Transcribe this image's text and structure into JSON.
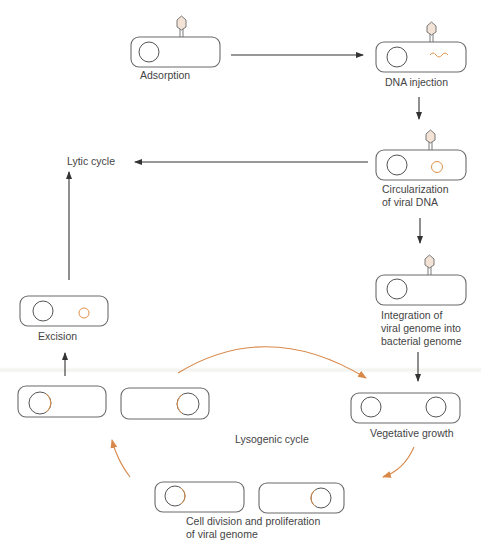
{
  "colors": {
    "cell_outline": "#6b6b6b",
    "bacterial_chromosome": "#555555",
    "viral_dna": "#e0924a",
    "lysogenic_arrows": "#d8894a",
    "main_arrows": "#333333"
  },
  "stages": [
    {
      "id": "adsorption",
      "label": "Adsorption"
    },
    {
      "id": "dna-injection",
      "label": "DNA injection"
    },
    {
      "id": "circularization",
      "label_line1": "Circularization",
      "label_line2": "of viral DNA"
    },
    {
      "id": "integration",
      "label_line1": "Integration of",
      "label_line2": "viral genome into",
      "label_line3": "bacterial genome"
    },
    {
      "id": "vegetative-growth",
      "label": "Vegetative growth"
    },
    {
      "id": "cell-division",
      "label_line1": "Cell division and proliferation",
      "label_line2": "of viral genome"
    },
    {
      "id": "excision",
      "label": "Excision"
    }
  ],
  "cycles": {
    "lytic": "Lytic cycle",
    "lysogenic": "Lysogenic cycle"
  }
}
